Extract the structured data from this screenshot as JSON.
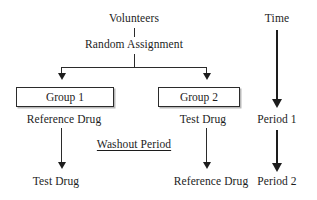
{
  "diagram": {
    "background_color": "#ffffff",
    "line_color": "#2b2b2b",
    "nodes": {
      "volunteers": "Volunteers",
      "random_assignment": "Random Assignment",
      "group1_box": "Group 1",
      "group2_box": "Group 2",
      "group1_period1_drug": "Reference Drug",
      "group2_period1_drug": "Test Drug",
      "washout": "Washout Period",
      "group1_period2_drug": "Test Drug",
      "group2_period2_drug": "Reference Drug"
    },
    "timeline": {
      "axis_label": "Time",
      "period1": "Period 1",
      "period2": "Period 2"
    }
  }
}
